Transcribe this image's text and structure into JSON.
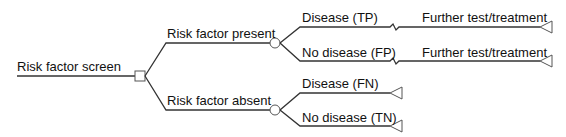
{
  "diagram": {
    "type": "decision-tree",
    "root": {
      "label": "Risk factor screen",
      "node_type": "decision"
    },
    "branches": [
      {
        "label": "Risk factor present",
        "node_type": "chance",
        "outcomes": [
          {
            "label": "Disease (TP)",
            "next": "Further test/treatment",
            "terminal": true
          },
          {
            "label": "No disease (FP)",
            "next": "Further test/treatment",
            "terminal": true
          }
        ]
      },
      {
        "label": "Risk factor absent",
        "node_type": "chance",
        "outcomes": [
          {
            "label": "Disease (FN)",
            "terminal": true
          },
          {
            "label": "No disease (TN)",
            "terminal": true
          }
        ]
      }
    ],
    "colors": {
      "line": "#333333",
      "node_stroke": "#555555",
      "text": "#111111",
      "background": "#ffffff"
    }
  }
}
